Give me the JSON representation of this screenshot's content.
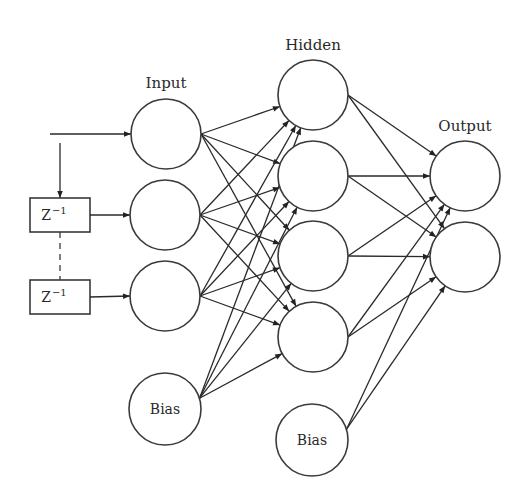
{
  "layers": {
    "input": {
      "label": "Input",
      "label_pos": [
        166,
        88
      ],
      "nodes": [
        {
          "id": "in1",
          "cx": 166,
          "cy": 134,
          "r": 35,
          "text": ""
        },
        {
          "id": "in2",
          "cx": 165,
          "cy": 215,
          "r": 35,
          "text": ""
        },
        {
          "id": "in3",
          "cx": 165,
          "cy": 296,
          "r": 35,
          "text": ""
        },
        {
          "id": "in_bias",
          "cx": 165,
          "cy": 409,
          "r": 36,
          "text": "Bias"
        }
      ]
    },
    "hidden": {
      "label": "Hidden",
      "label_pos": [
        313,
        50
      ],
      "nodes": [
        {
          "id": "h1",
          "cx": 313,
          "cy": 95,
          "r": 35,
          "text": ""
        },
        {
          "id": "h2",
          "cx": 313,
          "cy": 176,
          "r": 35,
          "text": ""
        },
        {
          "id": "h3",
          "cx": 313,
          "cy": 256,
          "r": 35,
          "text": ""
        },
        {
          "id": "h4",
          "cx": 313,
          "cy": 337,
          "r": 35,
          "text": ""
        },
        {
          "id": "h_bias",
          "cx": 312,
          "cy": 440,
          "r": 36,
          "text": "Bias"
        }
      ]
    },
    "output": {
      "label": "Output",
      "label_pos": [
        465,
        131
      ],
      "nodes": [
        {
          "id": "o1",
          "cx": 465,
          "cy": 176,
          "r": 35,
          "text": ""
        },
        {
          "id": "o2",
          "cx": 465,
          "cy": 257,
          "r": 35,
          "text": ""
        }
      ]
    }
  },
  "delays": [
    {
      "id": "z1",
      "x": 30,
      "y": 198,
      "w": 60,
      "h": 34,
      "text": "Z",
      "sup": "−1"
    },
    {
      "id": "z2",
      "x": 30,
      "y": 280,
      "w": 60,
      "h": 34,
      "text": "Z",
      "sup": "−1"
    }
  ],
  "input_signal": {
    "x1": 50,
    "y1": 134,
    "branch_x": 60,
    "branch_y": 143
  },
  "connections": {
    "input_to_hidden": {
      "from": [
        "in1",
        "in2",
        "in3",
        "in_bias"
      ],
      "to": [
        "h1",
        "h2",
        "h3",
        "h4"
      ]
    },
    "hidden_to_output": {
      "from": [
        "h1",
        "h2",
        "h3",
        "h4",
        "h_bias"
      ],
      "to": [
        "o1",
        "o2"
      ]
    }
  }
}
